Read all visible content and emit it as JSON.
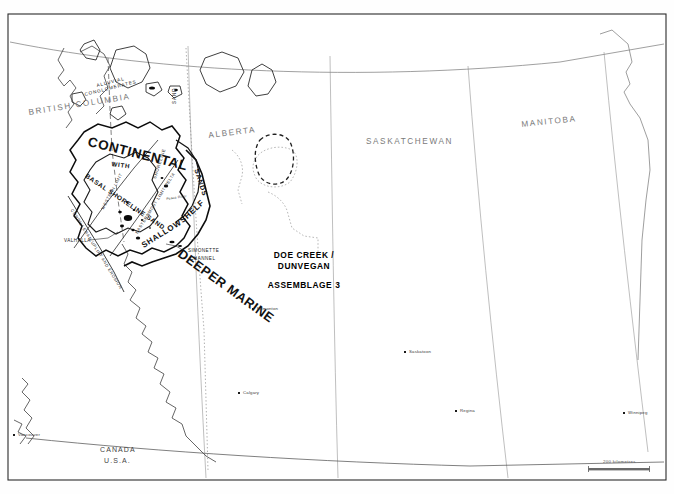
{
  "map": {
    "title_block": {
      "line1": "DOE CREEK /",
      "line2": "DUNVEGAN",
      "line3": "ASSEMBLAGE 3"
    },
    "provinces": [
      {
        "name": "BRITISH COLUMBIA",
        "x": 28,
        "y": 112,
        "rotate": -9
      },
      {
        "name": "ALBERTA",
        "x": 208,
        "y": 135,
        "rotate": -7
      },
      {
        "name": "SASKATCHEWAN",
        "x": 370,
        "y": 141,
        "rotate": 0
      },
      {
        "name": "MANITOBA",
        "x": 523,
        "y": 124,
        "rotate": -6
      }
    ],
    "cities": [
      {
        "name": "Edmonton",
        "x": 252,
        "y": 308
      },
      {
        "name": "Calgary",
        "x": 238,
        "y": 392
      },
      {
        "name": "Vancouver",
        "x": 13,
        "y": 434
      },
      {
        "name": "Saskatoon",
        "x": 404,
        "y": 351
      },
      {
        "name": "Regina",
        "x": 455,
        "y": 410
      },
      {
        "name": "Winnipeg",
        "x": 623,
        "y": 412
      }
    ],
    "border_labels": [
      {
        "text": "CANADA",
        "x": 100,
        "y": 450
      },
      {
        "text": "U.S.A.",
        "x": 104,
        "y": 461
      }
    ],
    "geology_labels": [
      {
        "text": "ALLUVIAL",
        "x": 96,
        "y": 85,
        "rotate": -14,
        "size": 4.6,
        "weight": "normal",
        "spacing": 0.9
      },
      {
        "text": "CONGLOMERATES",
        "x": 86,
        "y": 94,
        "rotate": -14,
        "size": 4.6,
        "weight": "normal",
        "spacing": 0.9
      },
      {
        "text": "SAND",
        "x": 172,
        "y": 104,
        "rotate": -90,
        "size": 4.6,
        "weight": "normal",
        "spacing": 0.9
      },
      {
        "text": "CONTINENTAL",
        "x": 92,
        "y": 146,
        "rotate": 14,
        "size": 13.5,
        "weight": "bold",
        "spacing": 0.6
      },
      {
        "text": "WITH",
        "x": 112,
        "y": 166,
        "rotate": 8,
        "size": 6.2,
        "weight": "bold",
        "spacing": 0.8
      },
      {
        "text": "BASAL SHORELINE SAND",
        "x": 90,
        "y": 178,
        "rotate": 34,
        "size": 6.4,
        "weight": "bold",
        "spacing": 0.7
      },
      {
        "text": "SHORELINE",
        "x": 152,
        "y": 178,
        "rotate": -72,
        "size": 4.4,
        "weight": "normal",
        "spacing": 0.7
      },
      {
        "text": "SANDS",
        "x": 200,
        "y": 172,
        "rotate": 72,
        "size": 7.0,
        "weight": "bold",
        "spacing": 0.7
      },
      {
        "text": "SHALLOW",
        "x": 142,
        "y": 246,
        "rotate": -32,
        "size": 8.0,
        "weight": "bold",
        "spacing": 0.7
      },
      {
        "text": "SHELF",
        "x": 180,
        "y": 222,
        "rotate": -42,
        "size": 8.0,
        "weight": "bold",
        "spacing": 0.7
      },
      {
        "text": "DEEPER MARINE",
        "x": 186,
        "y": 252,
        "rotate": 36,
        "size": 13.0,
        "weight": "bold",
        "spacing": 0.5
      },
      {
        "text": "WESTERN LIMIT",
        "x": 100,
        "y": 208,
        "rotate": -62,
        "size": 4.2,
        "weight": "normal",
        "spacing": 0.6
      },
      {
        "text": "EASTERNMOST LIMIT DELTA",
        "x": 134,
        "y": 232,
        "rotate": -58,
        "size": 4.2,
        "weight": "normal",
        "spacing": 0.6
      },
      {
        "text": "CORDILLERAN UPLIFT AND EROSION",
        "x": 76,
        "y": 210,
        "rotate": 58,
        "size": 4.2,
        "weight": "normal",
        "spacing": 0.6
      },
      {
        "text": "VALHALLA",
        "x": 66,
        "y": 241,
        "rotate": 0,
        "size": 4.6,
        "weight": "normal",
        "spacing": 0.5
      },
      {
        "text": "SIMONETTE",
        "x": 188,
        "y": 252,
        "rotate": 0,
        "size": 4.6,
        "weight": "normal",
        "spacing": 0.5
      },
      {
        "text": "CHANNEL",
        "x": 190,
        "y": 259,
        "rotate": 0,
        "size": 4.6,
        "weight": "normal",
        "spacing": 0.5
      },
      {
        "text": "Peace River",
        "x": 168,
        "y": 199,
        "rotate": -8,
        "size": 3.4,
        "weight": "normal",
        "spacing": 0.2
      }
    ],
    "scale": {
      "label": "200 kilometres",
      "x": 603,
      "y": 460,
      "bar_x": 588,
      "bar_y": 468,
      "bar_width": 62
    },
    "colors": {
      "frame": "#2b2b2b",
      "coastline": "#4d4d4d",
      "province_text": "#7a7a7a",
      "geology_text": "#111111",
      "city_dot": "#1a1a1a",
      "background": "#ffffff"
    }
  }
}
